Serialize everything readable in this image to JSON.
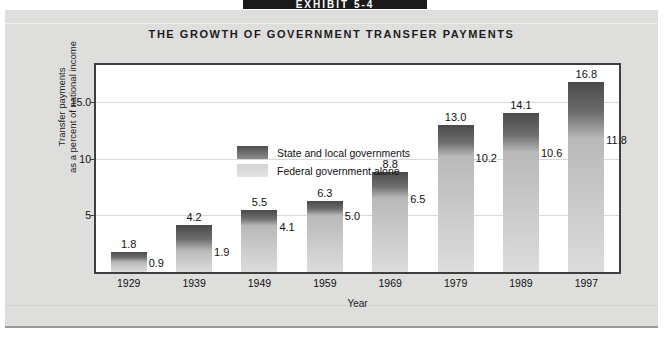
{
  "exhibit": {
    "tab_label": "EXHIBIT 5-4"
  },
  "figure": {
    "title": "THE GROWTH OF GOVERNMENT TRANSFER PAYMENTS"
  },
  "legend": {
    "items": [
      {
        "label": "State and local governments",
        "swatch": "dark-gray-gradient",
        "color": "#5a5a5a"
      },
      {
        "label": "Federal government alone",
        "swatch": "light-gray-gradient",
        "color": "#d8d8d8"
      }
    ]
  },
  "chart_data": {
    "type": "bar",
    "title": "THE GROWTH OF GOVERNMENT TRANSFER PAYMENTS",
    "xlabel": "Year",
    "ylabel": "Transfer payments as a percent of national income",
    "categories": [
      "1929",
      "1939",
      "1949",
      "1959",
      "1969",
      "1979",
      "1989",
      "1997"
    ],
    "series": [
      {
        "name": "State and local governments",
        "values": [
          1.8,
          4.2,
          5.5,
          6.3,
          8.8,
          13.0,
          14.1,
          16.8
        ]
      },
      {
        "name": "Federal government alone",
        "values": [
          0.9,
          1.9,
          4.1,
          5.0,
          6.5,
          10.2,
          10.6,
          11.8
        ]
      }
    ],
    "ylim": [
      0,
      18.3
    ],
    "yticks": [
      5,
      10,
      15.0
    ],
    "ytick_labels": [
      "5",
      "10",
      "15.0"
    ],
    "grid": true,
    "legend_position": "top-left-inside"
  },
  "axis": {
    "y_title_line1": "Transfer payments",
    "y_title_line2": "as a percent of national income",
    "x_title": "Year"
  }
}
